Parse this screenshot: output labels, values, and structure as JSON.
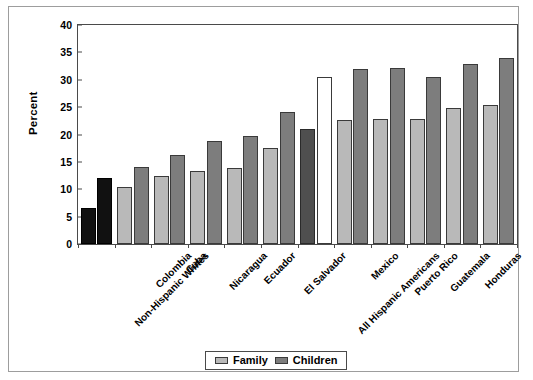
{
  "figure": {
    "clipped_header_text": "",
    "y_axis_title": "Percent"
  },
  "legend": {
    "position": "bottom-center",
    "entries": [
      {
        "label": "Family",
        "swatch": "light-gray-swatch",
        "color": "#b9b9b9"
      },
      {
        "label": "Children",
        "swatch": "dark-gray-swatch",
        "color": "#7d7d7d"
      }
    ]
  },
  "chart_data": {
    "type": "bar",
    "title": "",
    "subtitle": "",
    "xlabel": "",
    "ylabel": "Percent",
    "ylim": [
      0,
      40
    ],
    "yticks": [
      0,
      5,
      10,
      15,
      20,
      25,
      30,
      35,
      40
    ],
    "ytick_labels": [
      "0",
      "5",
      "10",
      "15",
      "20",
      "25",
      "30",
      "35",
      "40"
    ],
    "grid": false,
    "legend_position": "bottom-center",
    "categories": [
      "Non-Hispanic Whites",
      "Colombia",
      "Cuba",
      "Nicaragua",
      "Ecuador",
      "El Salvador",
      "All Hispanic Americans",
      "Mexico",
      "Puerto Rico",
      "Guatemala",
      "Honduras",
      "Dominican Republic"
    ],
    "series": [
      {
        "name": "Family",
        "color": "#b9b9b9",
        "values": [
          6.5,
          10.4,
          12.4,
          13.4,
          13.9,
          17.6,
          21.0,
          22.7,
          22.8,
          22.9,
          24.8,
          25.4
        ]
      },
      {
        "name": "Children",
        "color": "#7d7d7d",
        "values": [
          12.0,
          14.0,
          16.2,
          18.8,
          19.8,
          24.2,
          30.5,
          32.0,
          32.1,
          30.5,
          32.8,
          33.9
        ]
      }
    ],
    "highlighted_categories": [
      {
        "category": "Non-Hispanic Whites",
        "family_style": "black",
        "children_style": "black"
      },
      {
        "category": "All Hispanic Americans",
        "family_style": "dark",
        "children_style": "white"
      }
    ],
    "annotations": []
  }
}
